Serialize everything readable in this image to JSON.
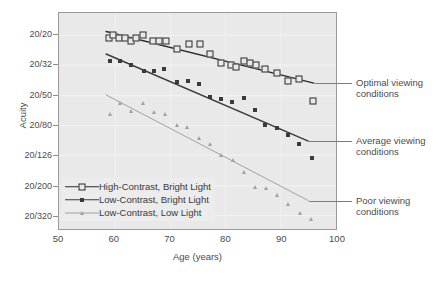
{
  "chart_data": {
    "type": "scatter",
    "title": "",
    "xlabel": "Age (years)",
    "ylabel": "Acuity",
    "xlim": [
      50,
      100
    ],
    "xticks": [
      50,
      60,
      70,
      80,
      90,
      100
    ],
    "ytick_labels": [
      "20/20",
      "20/32",
      "20/50",
      "20/80",
      "20/126",
      "20/200",
      "20/320"
    ],
    "ytick_values": [
      20,
      32,
      50,
      80,
      126,
      200,
      320
    ],
    "y_scale": "log (evenly spaced acuity steps, best at top)",
    "grid": "faint horizontal gridlines",
    "legend_position": "inside lower-left",
    "series": [
      {
        "name": "High-Contrast, Bright Light",
        "marker": "open-square",
        "color": "#2b2b2b",
        "annotation": "Optimal viewing conditions",
        "trendline": {
          "x": [
            58.5,
            96.0
          ],
          "y": [
            "20/19",
            "20/42"
          ]
        },
        "points": [
          {
            "x": 59.0,
            "y": "20/21"
          },
          {
            "x": 59.6,
            "y": "20/20"
          },
          {
            "x": 60.8,
            "y": "20/21"
          },
          {
            "x": 61.8,
            "y": "20/21"
          },
          {
            "x": 62.9,
            "y": "20/22"
          },
          {
            "x": 63.8,
            "y": "20/21"
          },
          {
            "x": 65.0,
            "y": "20/20"
          },
          {
            "x": 66.9,
            "y": "20/22"
          },
          {
            "x": 68.0,
            "y": "20/22"
          },
          {
            "x": 69.1,
            "y": "20/22"
          },
          {
            "x": 71.2,
            "y": "20/25"
          },
          {
            "x": 73.3,
            "y": "20/23"
          },
          {
            "x": 75.2,
            "y": "20/23"
          },
          {
            "x": 77.1,
            "y": "20/27"
          },
          {
            "x": 79.0,
            "y": "20/31"
          },
          {
            "x": 80.9,
            "y": "20/32"
          },
          {
            "x": 81.7,
            "y": "20/33"
          },
          {
            "x": 83.2,
            "y": "20/30"
          },
          {
            "x": 84.3,
            "y": "20/31"
          },
          {
            "x": 85.3,
            "y": "20/32"
          },
          {
            "x": 86.9,
            "y": "20/34"
          },
          {
            "x": 89.0,
            "y": "20/36"
          },
          {
            "x": 91.0,
            "y": "20/40"
          },
          {
            "x": 93.0,
            "y": "20/39"
          },
          {
            "x": 95.5,
            "y": "20/54"
          }
        ]
      },
      {
        "name": "Low-Contrast, Bright Light",
        "marker": "filled-square",
        "color": "#3a3a3a",
        "annotation": "Average viewing conditions",
        "trendline": {
          "x": [
            58.5,
            95.0
          ],
          "y": [
            "20/27",
            "20/102"
          ]
        },
        "points": [
          {
            "x": 59.2,
            "y": "20/30"
          },
          {
            "x": 61.0,
            "y": "20/30"
          },
          {
            "x": 62.9,
            "y": "20/32"
          },
          {
            "x": 65.2,
            "y": "20/35"
          },
          {
            "x": 67.0,
            "y": "20/35"
          },
          {
            "x": 68.9,
            "y": "20/34"
          },
          {
            "x": 71.2,
            "y": "20/41"
          },
          {
            "x": 73.2,
            "y": "20/40"
          },
          {
            "x": 75.0,
            "y": "20/42"
          },
          {
            "x": 77.1,
            "y": "20/51"
          },
          {
            "x": 79.1,
            "y": "20/53"
          },
          {
            "x": 81.0,
            "y": "20/55"
          },
          {
            "x": 83.2,
            "y": "20/52"
          },
          {
            "x": 85.1,
            "y": "20/62"
          },
          {
            "x": 87.0,
            "y": "20/79"
          },
          {
            "x": 89.1,
            "y": "20/82"
          },
          {
            "x": 91.1,
            "y": "20/92"
          },
          {
            "x": 93.1,
            "y": "20/104"
          },
          {
            "x": 95.3,
            "y": "20/130"
          }
        ]
      },
      {
        "name": "Low-Contrast, Low Light",
        "marker": "triangle",
        "color": "#a0a0a0",
        "annotation": "Poor viewing conditions",
        "trendline": {
          "x": [
            58.5,
            95.0
          ],
          "y": [
            "20/50",
            "20/255"
          ]
        },
        "points": [
          {
            "x": 59.2,
            "y": "20/66"
          },
          {
            "x": 61.0,
            "y": "20/56"
          },
          {
            "x": 62.9,
            "y": "20/63"
          },
          {
            "x": 65.1,
            "y": "20/56"
          },
          {
            "x": 67.0,
            "y": "20/64"
          },
          {
            "x": 69.0,
            "y": "20/66"
          },
          {
            "x": 71.1,
            "y": "20/79"
          },
          {
            "x": 73.0,
            "y": "20/81"
          },
          {
            "x": 75.1,
            "y": "20/96"
          },
          {
            "x": 77.0,
            "y": "20/104"
          },
          {
            "x": 79.0,
            "y": "20/124"
          },
          {
            "x": 81.1,
            "y": "20/133"
          },
          {
            "x": 83.2,
            "y": "20/160"
          },
          {
            "x": 85.2,
            "y": "20/200"
          },
          {
            "x": 87.1,
            "y": "20/205"
          },
          {
            "x": 89.0,
            "y": "20/228"
          },
          {
            "x": 91.1,
            "y": "20/262"
          },
          {
            "x": 93.2,
            "y": "20/300"
          },
          {
            "x": 95.2,
            "y": "20/330"
          }
        ]
      }
    ]
  },
  "legend": {
    "items": [
      {
        "label": "High-Contrast, Bright Light",
        "marker": "open-square"
      },
      {
        "label": "Low-Contrast, Bright Light",
        "marker": "filled-square"
      },
      {
        "label": "Low-Contrast, Low Light",
        "marker": "triangle"
      }
    ]
  },
  "annotations": [
    {
      "line1": "Optimal viewing",
      "line2": "conditions"
    },
    {
      "line1": "Average viewing",
      "line2": "conditions"
    },
    {
      "line1": "Poor viewing",
      "line2": "conditions"
    }
  ]
}
